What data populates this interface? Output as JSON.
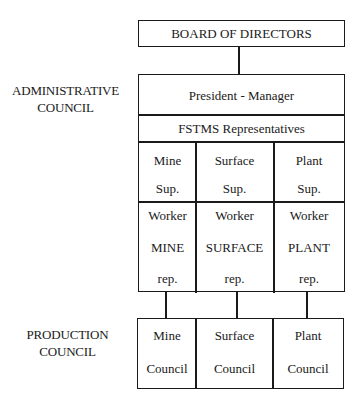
{
  "diagram": {
    "board": {
      "label": "BOARD OF DIRECTORS"
    },
    "administrative_council": {
      "label_line1": "ADMINISTRATIVE",
      "label_line2": "COUNCIL",
      "president": "President - Manager",
      "representatives": "FSTMS Representatives",
      "supervisors": [
        {
          "line1": "Mine",
          "line2": "Sup."
        },
        {
          "line1": "Surface",
          "line2": "Sup."
        },
        {
          "line1": "Plant",
          "line2": "Sup."
        }
      ],
      "workers": [
        {
          "line1": "Worker",
          "line2": "MINE",
          "line3": "rep."
        },
        {
          "line1": "Worker",
          "line2": "SURFACE",
          "line3": "rep."
        },
        {
          "line1": "Worker",
          "line2": "PLANT",
          "line3": "rep."
        }
      ]
    },
    "production_council": {
      "label_line1": "PRODUCTION",
      "label_line2": "COUNCIL",
      "councils": [
        {
          "line1": "Mine",
          "line2": "Council"
        },
        {
          "line1": "Surface",
          "line2": "Council"
        },
        {
          "line1": "Plant",
          "line2": "Council"
        }
      ]
    }
  }
}
